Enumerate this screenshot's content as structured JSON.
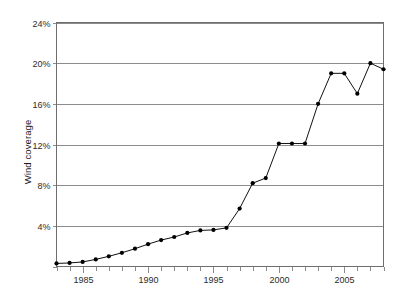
{
  "figure": {
    "caption": ""
  },
  "axes": {
    "ylabel": "Wind coverage",
    "xlabel": "",
    "yticks": [
      "4%",
      "8%",
      "12%",
      "16%",
      "20%",
      "24%"
    ],
    "xticks": [
      "1985",
      "1990",
      "1995",
      "2000",
      "2005"
    ]
  },
  "chart_data": {
    "type": "line",
    "title": "",
    "xlabel": "",
    "ylabel": "Wind coverage",
    "ylim": [
      0,
      24
    ],
    "xlim": [
      1983,
      2008
    ],
    "grid": true,
    "legend": false,
    "y_tick_values": [
      0,
      4,
      8,
      12,
      16,
      20,
      24
    ],
    "y_tick_labels": [
      "",
      "4%",
      "8%",
      "12%",
      "16%",
      "20%",
      "24%"
    ],
    "x_tick_values": [
      1985,
      1990,
      1995,
      2000,
      2005
    ],
    "x_tick_labels": [
      "1985",
      "1990",
      "1995",
      "2000",
      "2005"
    ],
    "x_minor_tick_step": 1,
    "marker": "filled-circle",
    "line_color": "#111111",
    "marker_color": "#000000",
    "grid_color": "#8c8c8c",
    "x": [
      1983,
      1984,
      1985,
      1986,
      1987,
      1988,
      1989,
      1990,
      1991,
      1992,
      1993,
      1994,
      1995,
      1996,
      1997,
      1998,
      1999,
      2000,
      2001,
      2002,
      2003,
      2004,
      2005,
      2006,
      2007,
      2008
    ],
    "values": [
      0.3,
      0.35,
      0.45,
      0.7,
      1.0,
      1.35,
      1.75,
      2.2,
      2.6,
      2.9,
      3.3,
      3.55,
      3.6,
      3.8,
      5.7,
      8.2,
      8.7,
      12.1,
      12.1,
      12.1,
      16.0,
      19.0,
      19.0,
      17.0,
      20.0,
      19.4
    ],
    "series": [
      {
        "name": "Wind coverage",
        "values": [
          0.3,
          0.35,
          0.45,
          0.7,
          1.0,
          1.35,
          1.75,
          2.2,
          2.6,
          2.9,
          3.3,
          3.55,
          3.6,
          3.8,
          5.7,
          8.2,
          8.7,
          12.1,
          12.1,
          12.1,
          16.0,
          19.0,
          19.0,
          17.0,
          20.0,
          19.4
        ]
      }
    ]
  }
}
